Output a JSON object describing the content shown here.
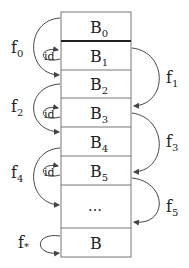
{
  "blocks": [
    {
      "name": "B",
      "sub": "0"
    },
    {
      "name": "B",
      "sub": "1"
    },
    {
      "name": "B",
      "sub": "2"
    },
    {
      "name": "B",
      "sub": "3"
    },
    {
      "name": "B",
      "sub": "4"
    },
    {
      "name": "B",
      "sub": "5"
    },
    {
      "name": "…",
      "sub": ""
    },
    {
      "name": "B",
      "sub": ""
    }
  ],
  "left_maps": [
    {
      "label": "f",
      "sub": "0"
    },
    {
      "label": "f",
      "sub": "2"
    },
    {
      "label": "f",
      "sub": "4"
    },
    {
      "label": "f",
      "sub": "*"
    }
  ],
  "right_maps": [
    {
      "label": "f",
      "sub": "1"
    },
    {
      "label": "f",
      "sub": "3"
    },
    {
      "label": "f",
      "sub": "5"
    }
  ],
  "id_label": "id"
}
